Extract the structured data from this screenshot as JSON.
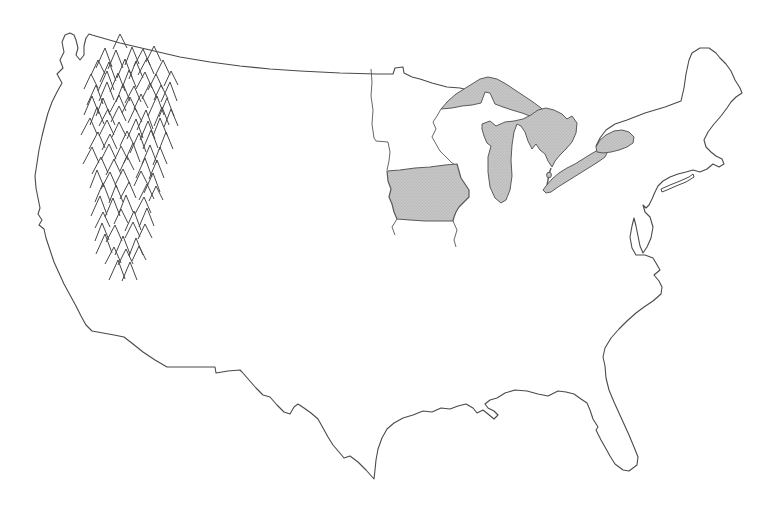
{
  "map": {
    "region_label": "Continental United States outline map",
    "background": "#ffffff",
    "outline_color": "#4a4a4a",
    "detail_line_color": "#565656",
    "shade_fill": "#c6c6c6",
    "shade_dot_color": "#aaaaaa",
    "shade_stroke": "#5a5a5a",
    "highlighted_state": "Iowa",
    "shaded_lakes": [
      "Lake Superior",
      "Lake Michigan",
      "Lake Huron",
      "Lake Erie",
      "Lake Ontario"
    ],
    "mountain_symbols": {
      "symbol": "chevron",
      "region": "northern-rocky-mountains",
      "color": "#474747",
      "points": [
        [
          122,
          36
        ],
        [
          104,
          48
        ],
        [
          117,
          48
        ],
        [
          130,
          48
        ],
        [
          143,
          48
        ],
        [
          156,
          48
        ],
        [
          97,
          60
        ],
        [
          110,
          60
        ],
        [
          123,
          60
        ],
        [
          136,
          60
        ],
        [
          149,
          60
        ],
        [
          162,
          60
        ],
        [
          92,
          72
        ],
        [
          105,
          72
        ],
        [
          118,
          72
        ],
        [
          131,
          72
        ],
        [
          144,
          72
        ],
        [
          157,
          72
        ],
        [
          169,
          72
        ],
        [
          96,
          84
        ],
        [
          109,
          84
        ],
        [
          122,
          84
        ],
        [
          135,
          84
        ],
        [
          148,
          84
        ],
        [
          161,
          84
        ],
        [
          172,
          84
        ],
        [
          91,
          96
        ],
        [
          104,
          96
        ],
        [
          117,
          96
        ],
        [
          130,
          96
        ],
        [
          143,
          96
        ],
        [
          156,
          96
        ],
        [
          168,
          96
        ],
        [
          95,
          108
        ],
        [
          108,
          108
        ],
        [
          121,
          108
        ],
        [
          134,
          108
        ],
        [
          147,
          108
        ],
        [
          160,
          108
        ],
        [
          171,
          108
        ],
        [
          92,
          120
        ],
        [
          106,
          120
        ],
        [
          120,
          120
        ],
        [
          134,
          120
        ],
        [
          148,
          120
        ],
        [
          162,
          120
        ],
        [
          97,
          132
        ],
        [
          111,
          132
        ],
        [
          125,
          132
        ],
        [
          139,
          132
        ],
        [
          153,
          132
        ],
        [
          165,
          132
        ],
        [
          93,
          145
        ],
        [
          107,
          145
        ],
        [
          121,
          145
        ],
        [
          135,
          145
        ],
        [
          149,
          145
        ],
        [
          161,
          145
        ],
        [
          99,
          158
        ],
        [
          114,
          158
        ],
        [
          129,
          158
        ],
        [
          144,
          158
        ],
        [
          158,
          158
        ],
        [
          95,
          171
        ],
        [
          110,
          171
        ],
        [
          125,
          171
        ],
        [
          140,
          171
        ],
        [
          154,
          171
        ],
        [
          101,
          184
        ],
        [
          116,
          184
        ],
        [
          131,
          184
        ],
        [
          146,
          184
        ],
        [
          157,
          184
        ],
        [
          98,
          197
        ],
        [
          113,
          197
        ],
        [
          128,
          197
        ],
        [
          143,
          197
        ],
        [
          104,
          210
        ],
        [
          119,
          210
        ],
        [
          134,
          210
        ],
        [
          149,
          210
        ],
        [
          101,
          223
        ],
        [
          116,
          223
        ],
        [
          131,
          223
        ],
        [
          145,
          223
        ],
        [
          107,
          236
        ],
        [
          122,
          236
        ],
        [
          137,
          236
        ],
        [
          112,
          248
        ],
        [
          126,
          248
        ],
        [
          141,
          248
        ],
        [
          117,
          260
        ],
        [
          131,
          260
        ]
      ]
    }
  }
}
